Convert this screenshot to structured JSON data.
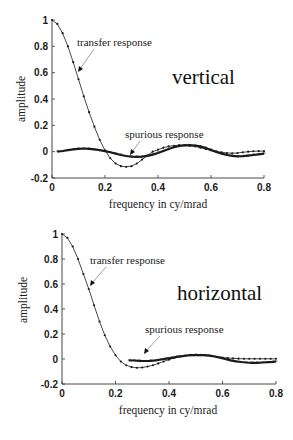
{
  "chart_data": [
    {
      "type": "line",
      "title": "vertical",
      "xlabel": "frequency in cy/mrad",
      "ylabel": "amplitude",
      "xlim": [
        0,
        0.8
      ],
      "ylim": [
        -0.2,
        1
      ],
      "xticks": [
        "0",
        "0.2",
        "0.4",
        "0.6",
        "0.8"
      ],
      "yticks": [
        "-0.2",
        "0",
        "0.2",
        "0.4",
        "0.6",
        "0.8",
        "1"
      ],
      "grid": false,
      "annotations": [
        "transfer response",
        "spurious response"
      ],
      "series": [
        {
          "name": "transfer response",
          "x": [
            0.0,
            0.02,
            0.04,
            0.06,
            0.08,
            0.1,
            0.12,
            0.14,
            0.16,
            0.18,
            0.2,
            0.22,
            0.24,
            0.26,
            0.28,
            0.3,
            0.32,
            0.34,
            0.36,
            0.38,
            0.4,
            0.42,
            0.44,
            0.46,
            0.48,
            0.5,
            0.52,
            0.54,
            0.56,
            0.58,
            0.6,
            0.62,
            0.64,
            0.66,
            0.68,
            0.7,
            0.72,
            0.74,
            0.76,
            0.78,
            0.8
          ],
          "values": [
            1.0,
            0.97,
            0.9,
            0.8,
            0.68,
            0.55,
            0.42,
            0.3,
            0.19,
            0.09,
            0.01,
            -0.05,
            -0.09,
            -0.11,
            -0.115,
            -0.11,
            -0.09,
            -0.06,
            -0.03,
            0.0,
            0.015,
            0.03,
            0.04,
            0.045,
            0.05,
            0.05,
            0.045,
            0.04,
            0.03,
            0.02,
            0.01,
            0.0,
            -0.005,
            -0.01,
            -0.012,
            -0.01,
            -0.005,
            0.0,
            0.003,
            0.004,
            0.004
          ]
        },
        {
          "name": "spurious response",
          "x": [
            0.02,
            0.04,
            0.06,
            0.08,
            0.1,
            0.12,
            0.14,
            0.16,
            0.18,
            0.2,
            0.22,
            0.24,
            0.26,
            0.28,
            0.3,
            0.32,
            0.34,
            0.36,
            0.38,
            0.4,
            0.42,
            0.44,
            0.46,
            0.48,
            0.5,
            0.52,
            0.54,
            0.56,
            0.58,
            0.6,
            0.62,
            0.64,
            0.66,
            0.68,
            0.7,
            0.72,
            0.74,
            0.76,
            0.78,
            0.8
          ],
          "values": [
            0.0,
            0.005,
            0.012,
            0.018,
            0.022,
            0.024,
            0.022,
            0.018,
            0.012,
            0.004,
            -0.005,
            -0.015,
            -0.025,
            -0.033,
            -0.038,
            -0.04,
            -0.038,
            -0.032,
            -0.022,
            -0.01,
            0.005,
            0.02,
            0.033,
            0.043,
            0.048,
            0.05,
            0.047,
            0.04,
            0.028,
            0.013,
            -0.002,
            -0.015,
            -0.025,
            -0.032,
            -0.035,
            -0.034,
            -0.03,
            -0.025,
            -0.02,
            -0.015
          ]
        }
      ]
    },
    {
      "type": "line",
      "title": "horizontal",
      "xlabel": "frequency in cy/mrad",
      "ylabel": "amplitude",
      "xlim": [
        0,
        0.8
      ],
      "ylim": [
        -0.2,
        1
      ],
      "xticks": [
        "0",
        "0.2",
        "0.4",
        "0.6",
        "0.8"
      ],
      "yticks": [
        "-0.2",
        "0",
        "0.2",
        "0.4",
        "0.6",
        "0.8",
        "1"
      ],
      "grid": false,
      "annotations": [
        "transfer response",
        "spurious response"
      ],
      "series": [
        {
          "name": "transfer response",
          "x": [
            0.0,
            0.02,
            0.04,
            0.06,
            0.08,
            0.1,
            0.12,
            0.14,
            0.16,
            0.18,
            0.2,
            0.22,
            0.24,
            0.26,
            0.28,
            0.3,
            0.32,
            0.34,
            0.36,
            0.38,
            0.4,
            0.42,
            0.44,
            0.46,
            0.48,
            0.5,
            0.52,
            0.54,
            0.56,
            0.58,
            0.6,
            0.62,
            0.64,
            0.66,
            0.68,
            0.7,
            0.72,
            0.74,
            0.76,
            0.78,
            0.8
          ],
          "values": [
            1.0,
            0.97,
            0.9,
            0.8,
            0.68,
            0.56,
            0.43,
            0.3,
            0.19,
            0.1,
            0.03,
            -0.02,
            -0.05,
            -0.065,
            -0.07,
            -0.068,
            -0.06,
            -0.05,
            -0.035,
            -0.02,
            -0.005,
            0.01,
            0.02,
            0.028,
            0.033,
            0.035,
            0.034,
            0.03,
            0.025,
            0.018,
            0.012,
            0.008,
            0.005,
            0.003,
            0.002,
            0.002,
            0.002,
            0.002,
            0.002,
            0.002,
            0.002
          ]
        },
        {
          "name": "spurious response",
          "x": [
            0.25,
            0.27,
            0.29,
            0.31,
            0.33,
            0.35,
            0.37,
            0.39,
            0.41,
            0.43,
            0.45,
            0.47,
            0.49,
            0.51,
            0.53,
            0.55,
            0.57,
            0.59,
            0.61,
            0.63,
            0.65,
            0.67,
            0.69,
            0.71,
            0.73,
            0.75,
            0.77,
            0.79,
            0.8
          ],
          "values": [
            -0.01,
            -0.012,
            -0.015,
            -0.016,
            -0.014,
            -0.01,
            -0.004,
            0.003,
            0.01,
            0.017,
            0.023,
            0.028,
            0.031,
            0.032,
            0.031,
            0.027,
            0.02,
            0.01,
            0.0,
            -0.01,
            -0.018,
            -0.024,
            -0.028,
            -0.03,
            -0.03,
            -0.028,
            -0.025,
            -0.022,
            -0.02
          ]
        }
      ]
    }
  ],
  "panels": [
    {
      "title": "vertical",
      "xlabel": "frequency in cy/mrad",
      "ylabel": "amplitude",
      "annot_transfer": "transfer response",
      "annot_spurious": "spurious response"
    },
    {
      "title": "horizontal",
      "xlabel": "frequency in cy/mrad",
      "ylabel": "amplitude",
      "annot_transfer": "transfer response",
      "annot_spurious": "spurious response"
    }
  ],
  "colors": {
    "line": "#1a1a1a",
    "axis": "#333333",
    "background": "#ffffff"
  }
}
